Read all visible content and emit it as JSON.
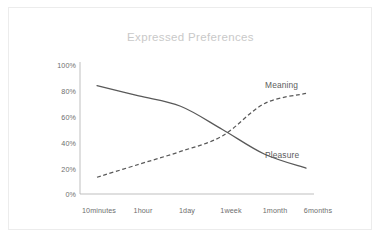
{
  "frame": {
    "background_color": "#ffffff",
    "border_color": "#ececec"
  },
  "chart_data": {
    "type": "line",
    "title": "Expressed Preferences",
    "xlabel": "",
    "ylabel": "",
    "categories": [
      "10minutes",
      "1hour",
      "1day",
      "1week",
      "1month",
      "6months"
    ],
    "ytick_labels": [
      "0%",
      "20%",
      "40%",
      "60%",
      "80%",
      "100%"
    ],
    "ytick_values": [
      0,
      20,
      40,
      60,
      80,
      100
    ],
    "ylim": [
      0,
      100
    ],
    "grid": false,
    "legend_position": "inline-right",
    "axis_color": "#b8b8b8",
    "title_color": "#c9c9c9",
    "tick_color": "#6e6e6e",
    "series": [
      {
        "name": "Pleasure",
        "style": "solid",
        "color": "#595959",
        "values": [
          84,
          76,
          68,
          50,
          31,
          20
        ],
        "label_x_pct": 71.5,
        "label_y_pct": 64.5
      },
      {
        "name": "Meaning",
        "style": "dashed",
        "color": "#595959",
        "values": [
          13,
          23,
          33,
          45,
          70,
          78
        ],
        "label_x_pct": 71.5,
        "label_y_pct": 34.0
      }
    ]
  }
}
